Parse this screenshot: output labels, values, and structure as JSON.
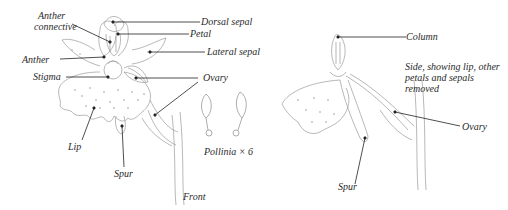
{
  "front_view": {
    "caption": "Front",
    "labels": {
      "anther_connective_1": "Anther",
      "anther_connective_2": "connective",
      "dorsal_sepal": "Dorsal sepal",
      "petal": "Petal",
      "lateral_sepal": "Lateral sepal",
      "anther": "Anther",
      "stigma": "Stigma",
      "ovary": "Ovary",
      "lip": "Lip",
      "spur": "Spur"
    }
  },
  "pollinia": {
    "caption": "Pollinia × 6"
  },
  "side_view": {
    "caption_1": "Side, showing lip, other",
    "caption_2": "petals and sepals",
    "caption_3": "removed",
    "labels": {
      "column": "Column",
      "ovary": "Ovary",
      "spur": "Spur"
    }
  },
  "colors": {
    "line": "#222222",
    "sketch": "#8a8a8a",
    "stipple": "#9a9a9a"
  }
}
